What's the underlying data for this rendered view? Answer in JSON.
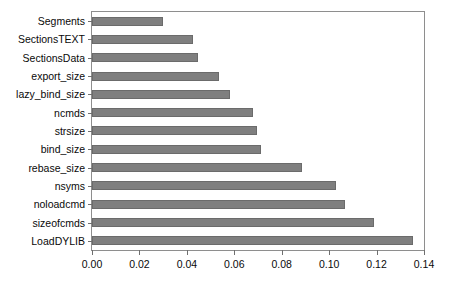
{
  "chart_data": {
    "type": "bar",
    "orientation": "horizontal",
    "title": "",
    "xlabel": "",
    "ylabel": "",
    "xlim": [
      0.0,
      0.14
    ],
    "ylim": null,
    "grid": false,
    "legend": null,
    "bar_color": "#7f7f7f",
    "bar_edge_color": "#6b6b6b",
    "axis_color": "#8e8e8e",
    "xticks": [
      "0.00",
      "0.02",
      "0.04",
      "0.06",
      "0.08",
      "0.10",
      "0.12",
      "0.14"
    ],
    "xtick_values": [
      0.0,
      0.02,
      0.04,
      0.06,
      0.08,
      0.1,
      0.12,
      0.14
    ],
    "categories": [
      "Segments",
      "SectionsTEXT",
      "SectionsData",
      "export_size",
      "lazy_bind_size",
      "ncmds",
      "strsize",
      "bind_size",
      "rebase_size",
      "nsyms",
      "noloadcmd",
      "sizeofcmds",
      "LoadDYLIB"
    ],
    "values": [
      0.03,
      0.0428,
      0.0449,
      0.0536,
      0.0583,
      0.0679,
      0.0696,
      0.0713,
      0.0885,
      0.103,
      0.1065,
      0.119,
      0.1354
    ]
  }
}
